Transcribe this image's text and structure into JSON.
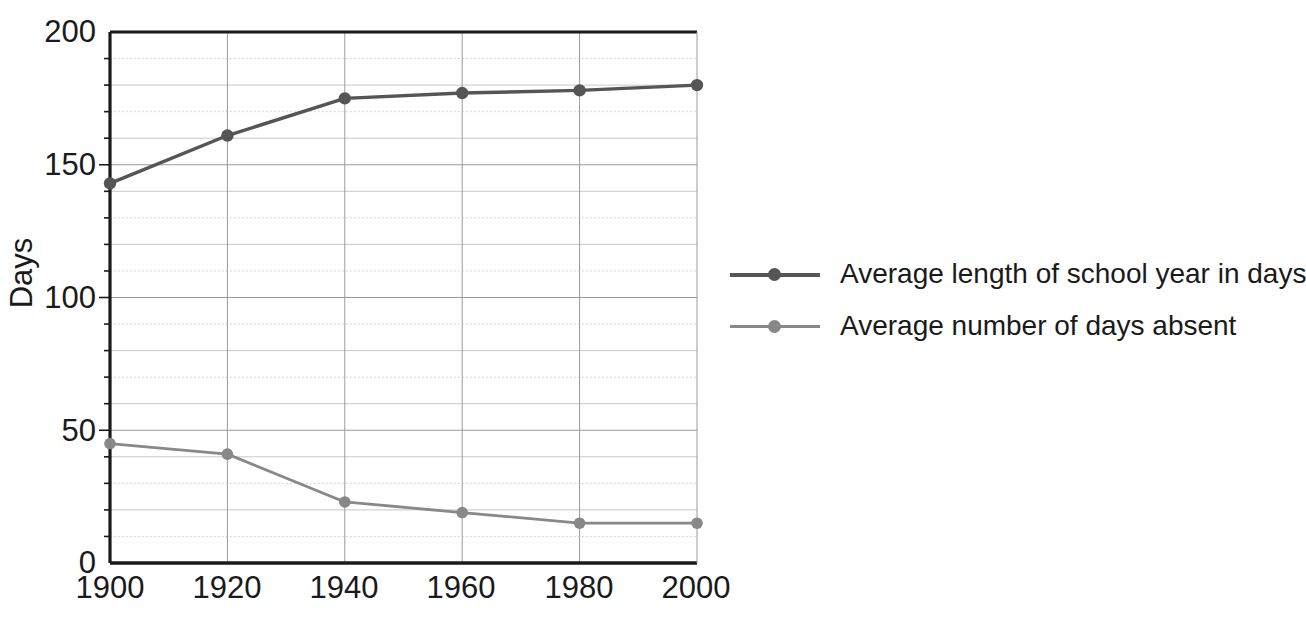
{
  "chart_data": {
    "type": "line",
    "title": "",
    "xlabel": "",
    "ylabel": "Days",
    "x": [
      1900,
      1920,
      1940,
      1960,
      1980,
      2000
    ],
    "categories": [
      "1900",
      "1920",
      "1940",
      "1960",
      "1980",
      "2000"
    ],
    "xlim": [
      1900,
      2000
    ],
    "ylim": [
      0,
      200
    ],
    "y_ticks": [
      0,
      50,
      100,
      150,
      200
    ],
    "y_tick_labels": [
      "0",
      "50",
      "100",
      "150",
      "200"
    ],
    "x_ticks": [
      1900,
      1920,
      1940,
      1960,
      1980,
      2000
    ],
    "x_tick_labels": [
      "1900",
      "1920",
      "1940",
      "1960",
      "1980",
      "2000"
    ],
    "y_minor_step": 10,
    "grid": true,
    "legend_position": "right",
    "series": [
      {
        "name": "Average length of school year in days",
        "values": [
          143,
          161,
          175,
          177,
          178,
          180
        ],
        "color": "#555555",
        "marker": "circle"
      },
      {
        "name": "Average number of days absent",
        "values": [
          45,
          41,
          23,
          19,
          15,
          15
        ],
        "color": "#888888",
        "marker": "circle"
      }
    ]
  },
  "axes": {
    "y_axis_title": "Days",
    "y_tick_labels": [
      "200",
      "150",
      "100",
      "50",
      "0"
    ],
    "x_tick_labels": [
      "1900",
      "1920",
      "1940",
      "1960",
      "1980",
      "2000"
    ]
  },
  "legend": {
    "items": [
      {
        "label": "Average length of school year in days",
        "color": "#555555"
      },
      {
        "label": "Average number of days absent",
        "color": "#888888"
      }
    ]
  },
  "colors": {
    "series1": "#555555",
    "series2": "#888888",
    "axis": "#1a1a1a",
    "grid_major": "#9a9a9a",
    "grid_minor": "#c8c8c8",
    "background": "#ffffff"
  }
}
